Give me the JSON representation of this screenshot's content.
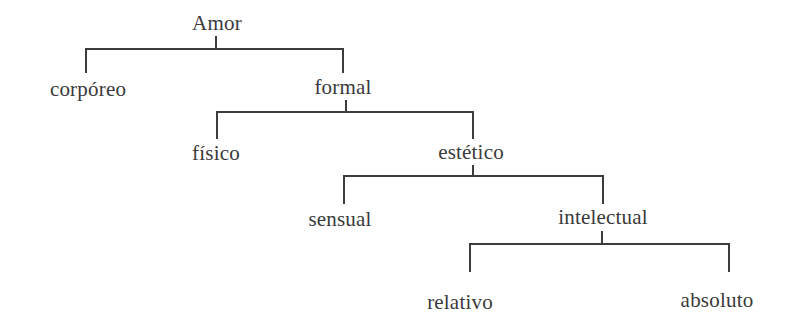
{
  "diagram": {
    "type": "tree",
    "root": "Amor",
    "nodes": {
      "amor": "Amor",
      "corporeo": "corpóreo",
      "formal": "formal",
      "fisico": "físico",
      "estetico": "estético",
      "sensual": "sensual",
      "intelectual": "intelectual",
      "relativo": "relativo",
      "absoluto": "absoluto"
    },
    "edges": [
      [
        "Amor",
        "corpóreo"
      ],
      [
        "Amor",
        "formal"
      ],
      [
        "formal",
        "físico"
      ],
      [
        "formal",
        "estético"
      ],
      [
        "estético",
        "sensual"
      ],
      [
        "estético",
        "intelectual"
      ],
      [
        "intelectual",
        "relativo"
      ],
      [
        "intelectual",
        "absoluto"
      ]
    ],
    "colors": {
      "line": "#3c3c3c",
      "text": "#3a3a3a",
      "background": "#ffffff"
    }
  }
}
